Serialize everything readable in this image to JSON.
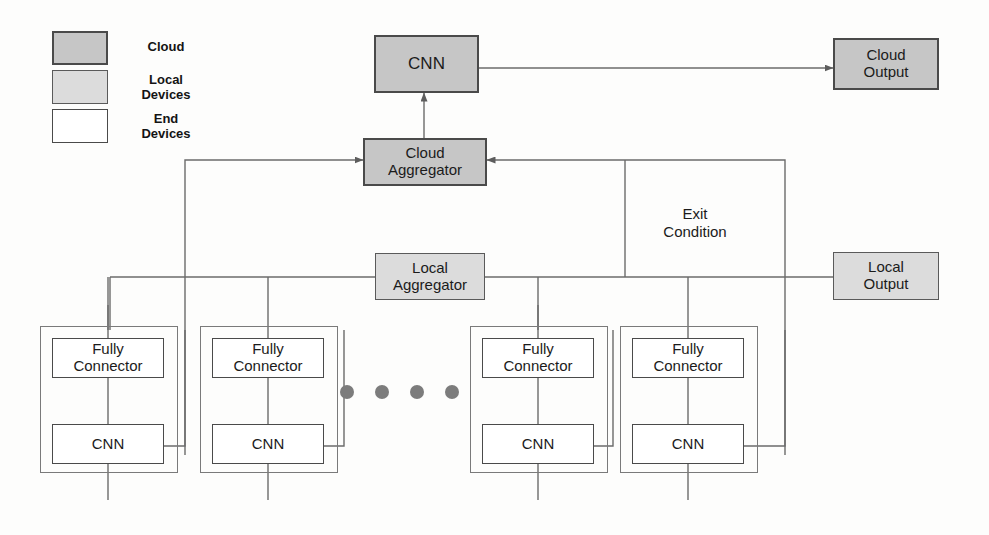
{
  "diagram": {
    "colors": {
      "cloud_fill": "#c6c6c6",
      "local_fill": "#dcdcdc",
      "end_fill": "#ffffff",
      "line": "#6b6b6b",
      "text": "#1b1b1b",
      "dot": "#7c7c7c"
    }
  },
  "legend": {
    "items": [
      {
        "label": "Cloud",
        "fill": "#c6c6c6",
        "kind": "cloud"
      },
      {
        "label": "Local\nDevices",
        "fill": "#dcdcdc",
        "kind": "local"
      },
      {
        "label": "End\nDevices",
        "fill": "#ffffff",
        "kind": "end"
      }
    ]
  },
  "cloud_tier": {
    "cnn": "CNN",
    "cloud_output": "Cloud\nOutput",
    "cloud_aggregator": "Cloud\nAggregator"
  },
  "local_tier": {
    "local_aggregator": "Local\nAggregator",
    "local_output": "Local\nOutput",
    "exit_condition": "Exit\nCondition"
  },
  "end_devices": [
    {
      "fully_connector": "Fully\nConnector",
      "cnn": "CNN"
    },
    {
      "fully_connector": "Fully\nConnector",
      "cnn": "CNN"
    },
    {
      "fully_connector": "Fully\nConnector",
      "cnn": "CNN"
    },
    {
      "fully_connector": "Fully\nConnector",
      "cnn": "CNN"
    }
  ],
  "ellipsis": {
    "count": 4
  }
}
